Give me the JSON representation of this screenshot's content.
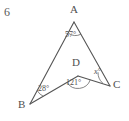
{
  "question_number": "6",
  "figure": {
    "name": "angle-diagram-arrowhead-abcd",
    "stroke_color": "#555555",
    "background_color": "#ffffff",
    "vertices": [
      {
        "id": "A",
        "label": "A",
        "x": 74,
        "y": 22,
        "label_x": 70,
        "label_y": 4
      },
      {
        "id": "B",
        "label": "B",
        "x": 30,
        "y": 104,
        "label_x": 18,
        "label_y": 99
      },
      {
        "id": "C",
        "label": "C",
        "x": 110,
        "y": 86,
        "label_x": 113,
        "label_y": 79
      },
      {
        "id": "D",
        "label": "D",
        "x": 78,
        "y": 76,
        "label_x": 72,
        "label_y": 57
      }
    ],
    "segments": [
      {
        "name": "segment-AB",
        "from": "A",
        "to": "B"
      },
      {
        "name": "segment-AC",
        "from": "A",
        "to": "C"
      },
      {
        "name": "segment-BD",
        "from": "B",
        "to": "D"
      },
      {
        "name": "segment-DC",
        "from": "D",
        "to": "C"
      }
    ],
    "angles": [
      {
        "name": "angle-at-A",
        "vertex": "A",
        "value": "57",
        "unit": "°",
        "text": "57°",
        "label_x": 65,
        "label_y": 31,
        "italic": false
      },
      {
        "name": "angle-at-B",
        "vertex": "B",
        "value": "28",
        "unit": "°",
        "text": "28°",
        "label_x": 38,
        "label_y": 85,
        "italic": false
      },
      {
        "name": "angle-at-D",
        "vertex": "D",
        "value": "121",
        "unit": "°",
        "text": "121°",
        "label_x": 66,
        "label_y": 79,
        "italic": false
      },
      {
        "name": "angle-at-C-unknown",
        "vertex": "C",
        "value": "x",
        "unit": "°",
        "text": "x°",
        "label_x": 94,
        "label_y": 68,
        "italic": true
      }
    ]
  }
}
